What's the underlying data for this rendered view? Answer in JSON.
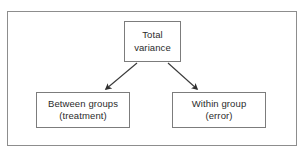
{
  "figure": {
    "background_color": "#ffffff",
    "frame_color": "#8d8d8d",
    "box_border_color": "#7c7c7c",
    "text_color": "#2b2b2b",
    "connector_color": "#3a3a3a"
  },
  "nodes": {
    "total": {
      "line1": "Total",
      "line2": "variance"
    },
    "between": {
      "line1": "Between groups",
      "line2": "(treatment)"
    },
    "within": {
      "line1": "Within group",
      "line2": "(error)"
    }
  },
  "connectors": [
    {
      "name": "total-to-between",
      "from": "total",
      "to": "between",
      "arrowhead": "filled-triangle",
      "direction": "down-left"
    },
    {
      "name": "total-to-within",
      "from": "total",
      "to": "within",
      "arrowhead": "filled-triangle",
      "direction": "down-right"
    }
  ]
}
